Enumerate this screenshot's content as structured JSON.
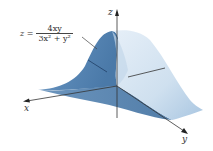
{
  "figure": {
    "type": "3d-surface-plot",
    "equation": {
      "lhs": "z =",
      "numerator": "4xy",
      "denominator": "3x² + y²",
      "full": "z = 4xy / (3x² + y²)"
    },
    "axes": {
      "x_label": "x",
      "y_label": "y",
      "z_label": "z"
    },
    "colors": {
      "surface_dark": "#4f7fae",
      "surface_mid": "#8fb3d6",
      "surface_light": "#dbe8f4",
      "axis_line": "#333333",
      "background": "#ffffff"
    }
  }
}
